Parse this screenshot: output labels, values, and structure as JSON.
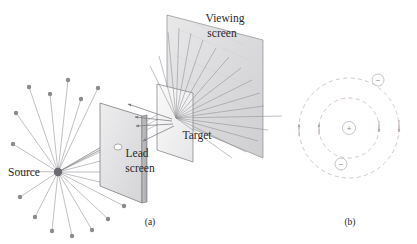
{
  "figure": {
    "width": 417,
    "height": 244,
    "background": "#ffffff"
  },
  "colors": {
    "ink": "#2a2a2a",
    "ray_line": "#8e8e92",
    "particle_dot": "#8a8a90",
    "source_dot": "#6a6a70",
    "screen_edge": "#6f6f74",
    "screen_fill_light": "#f2f2f3",
    "screen_fill_mid": "#dcdcde",
    "screen_fill_dark": "#c9c9cc",
    "orbit_dash": "#c9b9bd",
    "charge_circle_stroke": "#b6b6ba",
    "charge_glyph": "#8c8c8c",
    "arrow_head": "#7a7a80"
  },
  "panels": [
    {
      "id": "a",
      "caption": "(a)",
      "caption_x": 150,
      "caption_y": 225,
      "description": "Alpha particle source emits radially; a lead screen with a small aperture collimates a beam onto a thin metal foil target; scattered particles strike a viewing screen, a few backscatter.",
      "labels": [
        {
          "name": "source",
          "text": "Source",
          "x": 8,
          "y": 176,
          "anchor": "start"
        },
        {
          "name": "lead-screen-line1",
          "text": "Lead",
          "x": 137,
          "y": 157,
          "anchor": "middle"
        },
        {
          "name": "lead-screen-line2",
          "text": "screen",
          "x": 140,
          "y": 172,
          "anchor": "middle"
        },
        {
          "name": "target",
          "text": "Target",
          "x": 197,
          "y": 139,
          "anchor": "middle"
        },
        {
          "name": "viewing-screen-line1",
          "text": "Viewing",
          "x": 225,
          "y": 22,
          "anchor": "middle"
        },
        {
          "name": "viewing-screen-line2",
          "text": "screen",
          "x": 222,
          "y": 37,
          "anchor": "middle"
        }
      ],
      "components": {
        "source": {
          "x": 58,
          "y": 172,
          "radius": 4.2
        },
        "lead_screen": {
          "label": "lead-screen",
          "aperture_x": 115,
          "aperture_y": 128,
          "aperture_r": 3.2
        },
        "target": {
          "label": "target-foil"
        },
        "viewing_screen": {
          "label": "viewing-screen"
        }
      },
      "emission_rays": [
        {
          "angle_deg": -108,
          "length": 92
        },
        {
          "angle_deg": -96,
          "length": 80
        },
        {
          "angle_deg": -84,
          "length": 95
        },
        {
          "angle_deg": -72,
          "length": 72
        },
        {
          "angle_deg": -60,
          "length": 88
        },
        {
          "angle_deg": -48,
          "length": 66
        },
        {
          "angle_deg": -36,
          "length": 58
        },
        {
          "angle_deg": -24,
          "length": 64
        },
        {
          "angle_deg": -12,
          "length": 52
        },
        {
          "angle_deg": 0,
          "length": 56
        },
        {
          "angle_deg": 12,
          "length": 62
        },
        {
          "angle_deg": 24,
          "length": 70
        },
        {
          "angle_deg": 36,
          "length": 58
        },
        {
          "angle_deg": 48,
          "length": 64
        },
        {
          "angle_deg": 60,
          "length": 72
        },
        {
          "angle_deg": 72,
          "length": 66
        },
        {
          "angle_deg": 84,
          "length": 74
        },
        {
          "angle_deg": 96,
          "length": 62
        },
        {
          "angle_deg": 108,
          "length": 70
        },
        {
          "angle_deg": 120,
          "length": 56
        },
        {
          "angle_deg": 144,
          "length": 46
        },
        {
          "angle_deg": 168,
          "length": 42
        },
        {
          "angle_deg": -144,
          "length": 48
        },
        {
          "angle_deg": -168,
          "length": 44
        }
      ],
      "backscatter_arrow_count": 4,
      "scatter_ray_count": 16
    },
    {
      "id": "b",
      "caption": "(b)",
      "caption_x": 350,
      "caption_y": 225,
      "description": "Nuclear model of the atom: a small positive nucleus at the center with electrons travelling on dashed circular orbits.",
      "center": {
        "x": 349,
        "y": 128
      },
      "nucleus": {
        "symbol": "+",
        "radius": 6.5
      },
      "orbits": [
        {
          "name": "inner-orbit",
          "radius": 30,
          "dashed": true
        },
        {
          "name": "outer-orbit",
          "radius": 50,
          "dashed": true
        }
      ],
      "electrons": [
        {
          "name": "electron-outer",
          "symbol": "−",
          "x": 378,
          "y": 80,
          "radius": 6.0,
          "orbit": "outer-orbit"
        },
        {
          "name": "electron-inner",
          "symbol": "−",
          "x": 341,
          "y": 164,
          "radius": 6.0,
          "orbit": "inner-orbit"
        }
      ],
      "direction_markers": 4
    }
  ]
}
